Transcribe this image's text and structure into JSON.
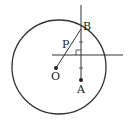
{
  "diagram": {
    "labels": {
      "B": "B",
      "P": "P",
      "O": "O",
      "A": "A"
    },
    "colors": {
      "stroke": "#333333",
      "background": "#ffffff"
    },
    "circle": {
      "cx": 59,
      "cy": 67,
      "r": 47
    },
    "points": {
      "O": [
        56,
        68
      ],
      "A": [
        81,
        80
      ],
      "B": [
        81,
        29
      ]
    }
  }
}
